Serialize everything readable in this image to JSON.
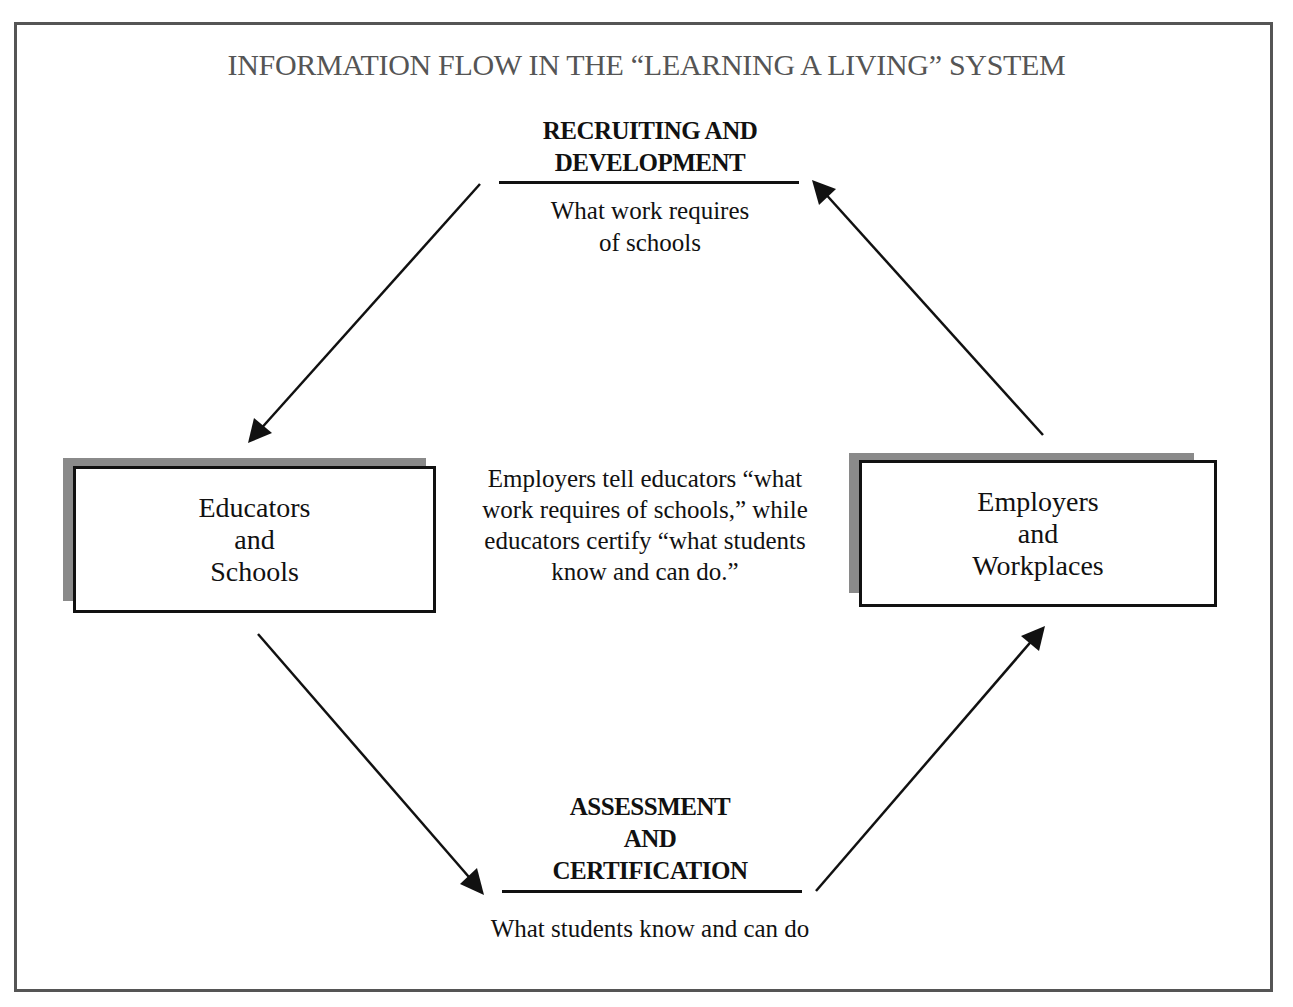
{
  "title": "INFORMATION FLOW IN THE “LEARNING A LIVING” SYSTEM",
  "top_section": {
    "heading_line1": "RECRUITING AND",
    "heading_line2": "DEVELOPMENT",
    "subtext_line1": "What work requires",
    "subtext_line2": "of schools"
  },
  "bottom_section": {
    "heading_line1": "ASSESSMENT",
    "heading_line2": "AND",
    "heading_line3": "CERTIFICATION",
    "subtext": "What students know and can do"
  },
  "left_box": {
    "line1": "Educators",
    "line2": "and",
    "line3": "Schools"
  },
  "right_box": {
    "line1": "Employers",
    "line2": "and",
    "line3": "Workplaces"
  },
  "center_text": {
    "line1": "Employers tell educators “what",
    "line2": "work requires of schools,” while",
    "line3": "educators certify “what students",
    "line4": "know and can do.”"
  },
  "arrows": [
    {
      "from": "recruiting-and-development",
      "to": "educators-and-schools"
    },
    {
      "from": "employers-and-workplaces",
      "to": "recruiting-and-development"
    },
    {
      "from": "educators-and-schools",
      "to": "assessment-and-certification"
    },
    {
      "from": "assessment-and-certification",
      "to": "employers-and-workplaces"
    }
  ],
  "colors": {
    "frame": "#555555",
    "title": "#555555",
    "ink": "#111111",
    "shadow": "#8a8a8a"
  }
}
